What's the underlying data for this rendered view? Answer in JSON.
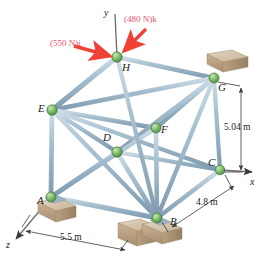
{
  "figure": {
    "colors": {
      "member": "#9db8cb",
      "member_highlight": "#d4e2ea",
      "member_shadow": "#7d99ad",
      "node": "#7bbf6a",
      "node_edge": "#4e8a42",
      "support_block": "#cdb79a",
      "support_block_dark": "#b0977a",
      "support_block_light": "#ded0bb",
      "force_arrow": "#ef4136",
      "force_text": "#e8536b",
      "axis": "#4a4a4a",
      "dimension": "#3a3a3a",
      "label_text": "#1a1a1a"
    }
  },
  "forces": [
    {
      "id": "force-550",
      "label": "(550 N)i",
      "x": 50,
      "y": 39
    },
    {
      "id": "force-480",
      "label": "(480 N)k",
      "x": 124,
      "y": 15
    }
  ],
  "axes": [
    {
      "id": "axis-y",
      "label": "y",
      "x": 104,
      "y": 8
    },
    {
      "id": "axis-x",
      "label": "x",
      "x": 250,
      "y": 177
    },
    {
      "id": "axis-z",
      "label": "z",
      "x": 6,
      "y": 240
    }
  ],
  "nodes": [
    {
      "id": "node-H",
      "label": "H",
      "cx": 117,
      "cy": 57,
      "lx": 122,
      "ly": 62
    },
    {
      "id": "node-G",
      "label": "G",
      "cx": 214,
      "cy": 78,
      "lx": 218,
      "ly": 82
    },
    {
      "id": "node-E",
      "label": "E",
      "cx": 52,
      "cy": 110,
      "lx": 38,
      "ly": 103
    },
    {
      "id": "node-F",
      "label": "F",
      "cx": 156,
      "cy": 128,
      "lx": 161,
      "ly": 124
    },
    {
      "id": "node-D",
      "label": "D",
      "cx": 117,
      "cy": 152,
      "lx": 103,
      "ly": 132
    },
    {
      "id": "node-C",
      "label": "C",
      "cx": 220,
      "cy": 170,
      "lx": 208,
      "ly": 157
    },
    {
      "id": "node-A",
      "label": "A",
      "cx": 51,
      "cy": 197,
      "lx": 37,
      "ly": 195
    },
    {
      "id": "node-B",
      "label": "B",
      "cx": 157,
      "cy": 218,
      "lx": 170,
      "ly": 216
    }
  ],
  "dimensions": [
    {
      "id": "dim-height",
      "label": "5.04 m",
      "x": 224,
      "y": 123
    },
    {
      "id": "dim-depth",
      "label": "4.8 m",
      "x": 196,
      "y": 198
    },
    {
      "id": "dim-width",
      "label": "5.5 m",
      "x": 60,
      "y": 233
    }
  ]
}
